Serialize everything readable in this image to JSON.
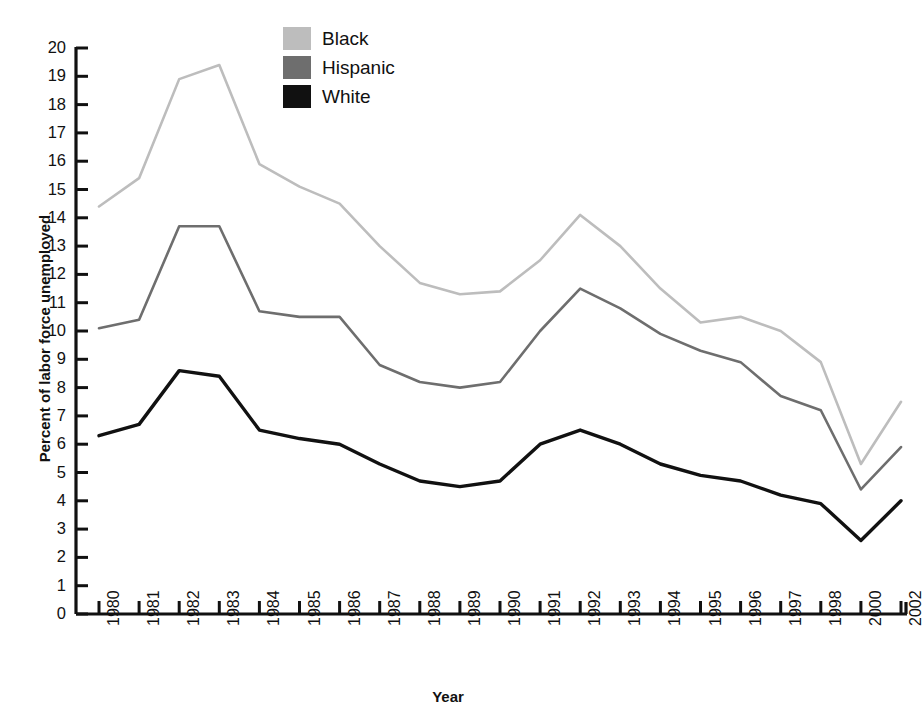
{
  "chart_data": {
    "type": "line",
    "title": "",
    "xlabel": "Year",
    "ylabel": "Percent of labor force unemployed",
    "ylim": [
      0,
      20
    ],
    "ytick_step": 1,
    "grid": false,
    "legend_position": "top-center",
    "categories": [
      "1980",
      "1981",
      "1982",
      "1983",
      "1984",
      "1985",
      "1986",
      "1987",
      "1988",
      "1989",
      "1990",
      "1991",
      "1992",
      "1993",
      "1994",
      "1995",
      "1996",
      "1997",
      "1998",
      "2000",
      "2002"
    ],
    "yticks": [
      "0",
      "1",
      "2",
      "3",
      "4",
      "5",
      "6",
      "7",
      "8",
      "9",
      "10",
      "11",
      "12",
      "13",
      "14",
      "15",
      "16",
      "17",
      "18",
      "19",
      "20"
    ],
    "series": [
      {
        "name": "Black",
        "color": "#bdbdbd",
        "values": [
          14.4,
          15.4,
          18.9,
          19.4,
          15.9,
          15.1,
          14.5,
          13.0,
          11.7,
          11.3,
          11.4,
          12.5,
          14.1,
          13.0,
          11.5,
          10.3,
          10.5,
          10.0,
          8.9,
          5.3,
          7.5
        ]
      },
      {
        "name": "Hispanic",
        "color": "#6e6e6e",
        "values": [
          10.1,
          10.4,
          13.7,
          13.7,
          10.7,
          10.5,
          10.5,
          8.8,
          8.2,
          8.0,
          8.2,
          10.0,
          11.5,
          10.8,
          9.9,
          9.3,
          8.9,
          7.7,
          7.2,
          4.4,
          5.9
        ]
      },
      {
        "name": "White",
        "color": "#111111",
        "values": [
          6.3,
          6.7,
          8.6,
          8.4,
          6.5,
          6.2,
          6.0,
          5.3,
          4.7,
          4.5,
          4.7,
          6.0,
          6.5,
          6.0,
          5.3,
          4.9,
          4.7,
          4.2,
          3.9,
          2.6,
          4.0
        ]
      }
    ]
  },
  "legend": {
    "items": [
      {
        "label": "Black",
        "color": "#bdbdbd"
      },
      {
        "label": "Hispanic",
        "color": "#6e6e6e"
      },
      {
        "label": "White",
        "color": "#111111"
      }
    ]
  },
  "axes": {
    "x_title": "Year",
    "y_title": "Percent of labor force unemployed",
    "axis_color": "#111111"
  }
}
